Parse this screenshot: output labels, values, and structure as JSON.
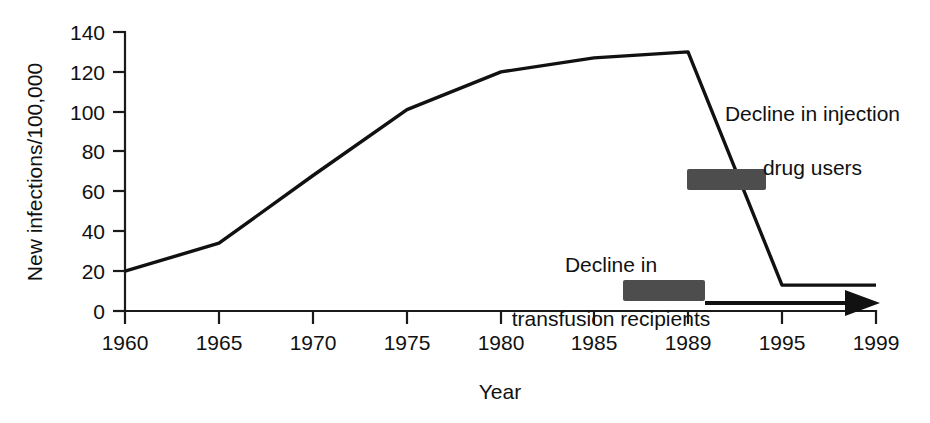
{
  "chart_data": {
    "type": "line",
    "title": "",
    "xlabel": "Year",
    "ylabel": "New infections/100,000",
    "x_ticks": [
      "1960",
      "1965",
      "1970",
      "1975",
      "1980",
      "1985",
      "1989",
      "1995",
      "1999"
    ],
    "y_ticks": [
      "0",
      "20",
      "40",
      "60",
      "80",
      "100",
      "120",
      "140"
    ],
    "ylim": [
      0,
      140
    ],
    "grid": false,
    "legend": "none",
    "categories": [
      "1960",
      "1965",
      "1970",
      "1975",
      "1980",
      "1985",
      "1989",
      "1995",
      "1999"
    ],
    "values": [
      20,
      34,
      68,
      101,
      120,
      127,
      130,
      13,
      13
    ],
    "series": [
      {
        "name": "New infections per 100,000",
        "points": [
          {
            "x": "1960",
            "y": 20
          },
          {
            "x": "1965",
            "y": 34
          },
          {
            "x": "1970",
            "y": 68
          },
          {
            "x": "1975",
            "y": 101
          },
          {
            "x": "1980",
            "y": 120
          },
          {
            "x": "1985",
            "y": 127
          },
          {
            "x": "1989",
            "y": 130
          },
          {
            "x": "1995",
            "y": 13
          },
          {
            "x": "1999",
            "y": 13
          }
        ]
      }
    ],
    "annotations": [
      {
        "id": "injection-drug-users",
        "text": "Decline in injection\ndrug users",
        "marker": "bar",
        "marker_color": "#4d4d4d",
        "marker_x_range": [
          "1989",
          "1992"
        ],
        "marker_y": 68
      },
      {
        "id": "transfusion-recipients",
        "text": "Decline in\ntransfusion recipients",
        "marker": "bar",
        "marker_color": "#4d4d4d",
        "marker_x_range": [
          "1987",
          "1990"
        ],
        "marker_y": 13
      },
      {
        "id": "timeline-arrow",
        "text": "",
        "marker": "arrow",
        "marker_color": "#111111",
        "marker_x_range": [
          "1990",
          "1998"
        ],
        "marker_y": 3
      }
    ]
  },
  "axes": {
    "y_label": "New infections/100,000",
    "x_label": "Year",
    "y_tick_labels": [
      "140",
      "120",
      "100",
      "80",
      "60",
      "40",
      "20",
      "0"
    ],
    "x_tick_labels": [
      "1960",
      "1965",
      "1970",
      "1975",
      "1980",
      "1985",
      "1989",
      "1995",
      "1999"
    ]
  },
  "annotations": {
    "injection": {
      "line1": "Decline in injection",
      "line2": "drug users"
    },
    "transfusion": {
      "line1": "Decline in",
      "line2": "transfusion recipients"
    }
  },
  "colors": {
    "ink": "#111111",
    "bar": "#4d4d4d",
    "background": "#ffffff"
  }
}
